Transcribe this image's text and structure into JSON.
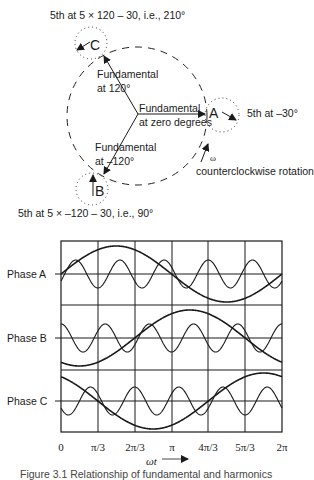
{
  "phasor_diagram": {
    "title_top": "5th at 5 × 120 – 30, i.e., 210°",
    "title_bottom": "5th at 5 × –120 – 30, i.e., 90°",
    "fund_120": [
      "Fundamental",
      "at 120°"
    ],
    "fund_0": [
      "Fundamental",
      "at zero degrees"
    ],
    "fund_m120": [
      "Fundamental",
      "at –120°"
    ],
    "fifth_a": "5th at –30°",
    "omega": "ω",
    "rotation": "counterclockwise rotation",
    "phase_letters": {
      "a": "A",
      "b": "B",
      "c": "C"
    }
  },
  "waveform_chart": {
    "row_labels": [
      "Phase A",
      "Phase B",
      "Phase C"
    ],
    "x_ticks": [
      "0",
      "π/3",
      "2π/3",
      "π",
      "4π/3",
      "5π/3",
      "2π"
    ],
    "x_label": "ωt",
    "caption": "Figure 3.1 Relationship of fundamental and harmonics"
  },
  "chart_data": {
    "type": "line",
    "title": "",
    "xlabel": "ωt",
    "ylabel": "",
    "x_ticks": [
      "0",
      "π/3",
      "2π/3",
      "π",
      "4π/3",
      "5π/3",
      "2π"
    ],
    "xlim": [
      0,
      6.2832
    ],
    "grid": true,
    "panels": [
      {
        "name": "Phase A",
        "series": [
          {
            "name": "Fundamental",
            "formula": "sin(ωt)",
            "amplitude": 1.0,
            "phase_deg": 0
          },
          {
            "name": "5th harmonic",
            "formula": "0.5·sin(5ωt − 30°)",
            "amplitude": 0.5,
            "phase_deg": -30
          }
        ]
      },
      {
        "name": "Phase B",
        "series": [
          {
            "name": "Fundamental",
            "formula": "sin(ωt − 120°)",
            "amplitude": 1.0,
            "phase_deg": -120
          },
          {
            "name": "5th harmonic",
            "formula": "0.5·sin(5ωt + 90°)",
            "amplitude": 0.5,
            "phase_deg": 90
          }
        ]
      },
      {
        "name": "Phase C",
        "series": [
          {
            "name": "Fundamental",
            "formula": "sin(ωt + 120°)",
            "amplitude": 1.0,
            "phase_deg": 120
          },
          {
            "name": "5th harmonic",
            "formula": "0.5·sin(5ωt + 210°)",
            "amplitude": 0.5,
            "phase_deg": 210
          }
        ]
      }
    ]
  }
}
